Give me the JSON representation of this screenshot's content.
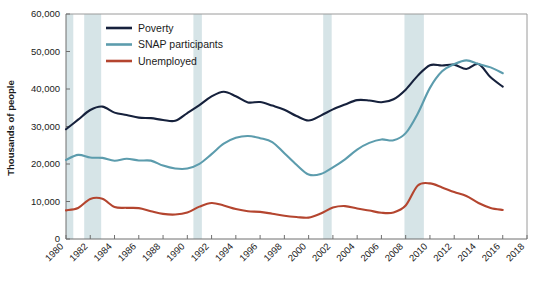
{
  "chart_data": {
    "type": "line",
    "title": "",
    "xlabel": "",
    "ylabel": "Thousands of people",
    "xlim": [
      1980,
      2018
    ],
    "ylim": [
      0,
      60000
    ],
    "grid": false,
    "legend_position": "top-left-inside",
    "y_ticks": [
      0,
      10000,
      20000,
      30000,
      40000,
      50000,
      60000
    ],
    "y_tick_labels": [
      "0",
      "10,000",
      "20,000",
      "30,000",
      "40,000",
      "50,000",
      "60,000"
    ],
    "x_ticks": [
      1980,
      1982,
      1984,
      1986,
      1988,
      1990,
      1992,
      1994,
      1996,
      1998,
      2000,
      2002,
      2004,
      2006,
      2008,
      2010,
      2012,
      2014,
      2016,
      2018
    ],
    "x_tick_labels": [
      "1980",
      "1982",
      "1984",
      "1986",
      "1988",
      "1990",
      "1992",
      "1994",
      "1996",
      "1998",
      "2000",
      "2002",
      "2004",
      "2006",
      "2008",
      "2010",
      "2012",
      "2014",
      "2016",
      "2018"
    ],
    "x": [
      1980,
      1981,
      1982,
      1983,
      1984,
      1985,
      1986,
      1987,
      1988,
      1989,
      1990,
      1991,
      1992,
      1993,
      1994,
      1995,
      1996,
      1997,
      1998,
      1999,
      2000,
      2001,
      2002,
      2003,
      2004,
      2005,
      2006,
      2007,
      2008,
      2009,
      2010,
      2011,
      2012,
      2013,
      2014,
      2015,
      2016
    ],
    "series": [
      {
        "name": "Poverty",
        "color": "#16213c",
        "values": [
          29272,
          31822,
          34398,
          35303,
          33700,
          33064,
          32370,
          32221,
          31745,
          31528,
          33585,
          35708,
          38014,
          39265,
          38059,
          36425,
          36529,
          35574,
          34476,
          32790,
          31581,
          32907,
          34570,
          35861,
          37040,
          36950,
          36460,
          37276,
          39829,
          43569,
          46343,
          46247,
          46496,
          45318,
          46657,
          43123,
          40616
        ]
      },
      {
        "name": "SNAP participants",
        "color": "#5c9cad",
        "values": [
          21082,
          22430,
          21717,
          21625,
          20854,
          21407,
          20932,
          20894,
          19576,
          18806,
          18803,
          20049,
          22625,
          25407,
          26987,
          27474,
          26883,
          25861,
          22858,
          19788,
          17194,
          17318,
          19096,
          21250,
          23858,
          25628,
          26549,
          26316,
          28223,
          33490,
          40302,
          44709,
          46609,
          47636,
          46664,
          45767,
          44220
        ]
      },
      {
        "name": "Unemployed",
        "color": "#b4452f",
        "values": [
          7637,
          8273,
          10678,
          10717,
          8539,
          8312,
          8237,
          7425,
          6701,
          6528,
          7047,
          8628,
          9613,
          8940,
          7996,
          7404,
          7236,
          6739,
          6210,
          5880,
          5692,
          6801,
          8378,
          8774,
          8149,
          7591,
          7001,
          7078,
          8924,
          14265,
          14825,
          13747,
          12506,
          11460,
          9617,
          8296,
          7751
        ]
      }
    ],
    "recession_bands": [
      {
        "start": 1980.0,
        "end": 1980.6
      },
      {
        "start": 1981.5,
        "end": 1982.9
      },
      {
        "start": 1990.5,
        "end": 1991.2
      },
      {
        "start": 2001.2,
        "end": 2001.9
      },
      {
        "start": 2007.9,
        "end": 2009.5
      }
    ],
    "recession_band_color": "#cfdfe3",
    "plot_background": "#ffffff"
  },
  "legend": {
    "items": [
      {
        "label": "Poverty",
        "color": "#16213c"
      },
      {
        "label": "SNAP participants",
        "color": "#5c9cad"
      },
      {
        "label": "Unemployed",
        "color": "#b4452f"
      }
    ]
  }
}
